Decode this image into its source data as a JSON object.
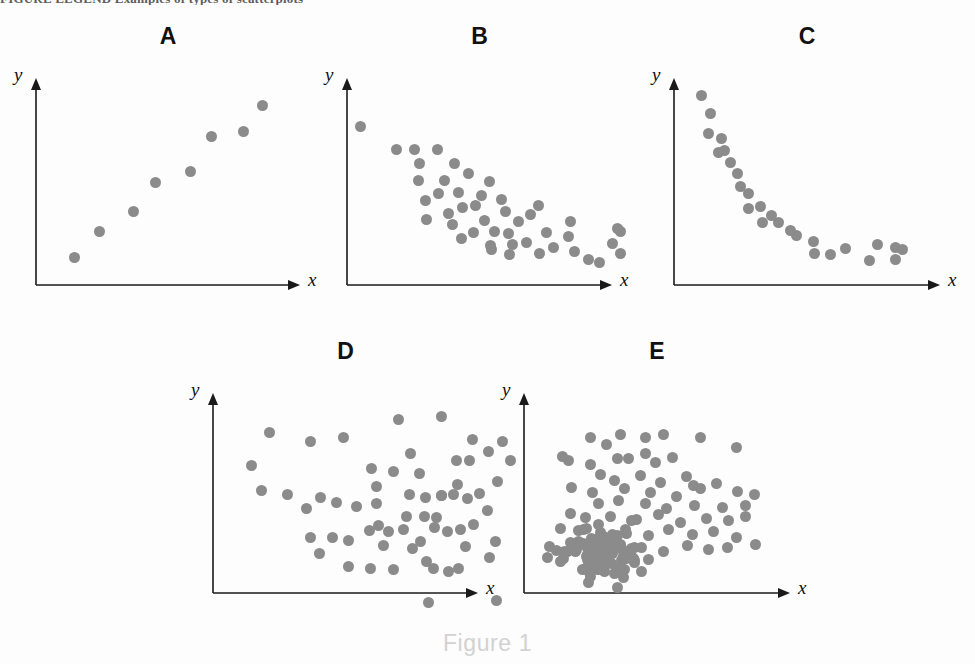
{
  "page": {
    "width": 975,
    "height": 664,
    "background_color": "#fdfdfd",
    "top_clipped_text": "FIGURE LEGEND  Examples of types of scatterplots",
    "caption": "Figure 1"
  },
  "style": {
    "dot_color": "#8b8b8b",
    "axis_color": "#1a1a1a",
    "letter_color": "#111111",
    "caption_color": "#d2d2d2",
    "dot_radius_px": 5.5
  },
  "chart_data": [
    {
      "id": "A",
      "type": "scatter",
      "title": "A",
      "xlabel": "x",
      "ylabel": "y",
      "pattern": "strong positive linear correlation",
      "n_points": 8,
      "axis": {
        "origin_x": 36,
        "origin_y": 285,
        "top_y": 78,
        "right_x": 300
      },
      "points": [
        [
          74,
          257
        ],
        [
          99,
          231
        ],
        [
          133,
          211
        ],
        [
          155,
          182
        ],
        [
          190,
          171
        ],
        [
          211,
          136
        ],
        [
          243,
          131
        ],
        [
          262,
          105
        ]
      ]
    },
    {
      "id": "B",
      "type": "scatter",
      "title": "B",
      "xlabel": "x",
      "ylabel": "y",
      "pattern": "moderate negative correlation with scatter",
      "n_points": 46,
      "axis": {
        "origin_x": 347,
        "origin_y": 285,
        "top_y": 78,
        "right_x": 612
      },
      "points": [
        [
          360,
          126
        ],
        [
          396,
          149
        ],
        [
          414,
          149
        ],
        [
          437,
          149
        ],
        [
          419,
          163
        ],
        [
          418,
          180
        ],
        [
          454,
          163
        ],
        [
          444,
          180
        ],
        [
          438,
          193
        ],
        [
          458,
          192
        ],
        [
          425,
          200
        ],
        [
          468,
          173
        ],
        [
          462,
          207
        ],
        [
          426,
          219
        ],
        [
          448,
          213
        ],
        [
          452,
          224
        ],
        [
          475,
          205
        ],
        [
          481,
          195
        ],
        [
          484,
          220
        ],
        [
          489,
          181
        ],
        [
          501,
          199
        ],
        [
          505,
          211
        ],
        [
          461,
          238
        ],
        [
          473,
          232
        ],
        [
          490,
          245
        ],
        [
          491,
          249
        ],
        [
          494,
          231
        ],
        [
          508,
          233
        ],
        [
          512,
          244
        ],
        [
          518,
          221
        ],
        [
          509,
          254
        ],
        [
          526,
          242
        ],
        [
          530,
          214
        ],
        [
          538,
          205
        ],
        [
          539,
          253
        ],
        [
          546,
          232
        ],
        [
          553,
          247
        ],
        [
          568,
          236
        ],
        [
          570,
          221
        ],
        [
          574,
          251
        ],
        [
          612,
          243
        ],
        [
          617,
          228
        ],
        [
          620,
          231
        ],
        [
          620,
          253
        ],
        [
          588,
          259
        ],
        [
          599,
          262
        ]
      ]
    },
    {
      "id": "C",
      "type": "scatter",
      "title": "C",
      "xlabel": "x",
      "ylabel": "y",
      "pattern": "nonlinear / exponential decay relationship",
      "n_points": 26,
      "axis": {
        "origin_x": 674,
        "origin_y": 285,
        "top_y": 78,
        "right_x": 940
      },
      "points": [
        [
          701,
          95
        ],
        [
          710,
          113
        ],
        [
          708,
          133
        ],
        [
          721,
          138
        ],
        [
          718,
          152
        ],
        [
          724,
          150
        ],
        [
          737,
          173
        ],
        [
          740,
          186
        ],
        [
          748,
          193
        ],
        [
          748,
          208
        ],
        [
          760,
          206
        ],
        [
          762,
          222
        ],
        [
          778,
          222
        ],
        [
          796,
          235
        ],
        [
          813,
          241
        ],
        [
          814,
          253
        ],
        [
          830,
          254
        ],
        [
          845,
          248
        ],
        [
          869,
          260
        ],
        [
          877,
          244
        ],
        [
          895,
          247
        ],
        [
          895,
          259
        ],
        [
          902,
          249
        ],
        [
          790,
          230
        ],
        [
          771,
          215
        ],
        [
          730,
          162
        ]
      ]
    },
    {
      "id": "D",
      "type": "scatter",
      "title": "D",
      "xlabel": "x",
      "ylabel": "y",
      "pattern": "no correlation / random uniform scatter",
      "n_points": 64,
      "axis": {
        "origin_x": 213,
        "origin_y": 593,
        "top_y": 393,
        "right_x": 478
      },
      "points": [
        [
          269,
          432
        ],
        [
          251,
          465
        ],
        [
          310,
          441
        ],
        [
          343,
          437
        ],
        [
          371,
          468
        ],
        [
          398,
          419
        ],
        [
          410,
          453
        ],
        [
          441,
          416
        ],
        [
          441,
          495
        ],
        [
          456,
          460
        ],
        [
          457,
          484
        ],
        [
          469,
          460
        ],
        [
          472,
          439
        ],
        [
          479,
          493
        ],
        [
          261,
          490
        ],
        [
          287,
          494
        ],
        [
          306,
          508
        ],
        [
          320,
          497
        ],
        [
          336,
          502
        ],
        [
          356,
          506
        ],
        [
          376,
          486
        ],
        [
          376,
          503
        ],
        [
          393,
          471
        ],
        [
          406,
          516
        ],
        [
          424,
          516
        ],
        [
          436,
          517
        ],
        [
          441,
          495
        ],
        [
          378,
          525
        ],
        [
          310,
          537
        ],
        [
          332,
          537
        ],
        [
          348,
          540
        ],
        [
          369,
          530
        ],
        [
          388,
          531
        ],
        [
          403,
          529
        ],
        [
          412,
          548
        ],
        [
          420,
          541
        ],
        [
          434,
          527
        ],
        [
          447,
          531
        ],
        [
          460,
          529
        ],
        [
          473,
          524
        ],
        [
          487,
          510
        ],
        [
          497,
          481
        ],
        [
          409,
          494
        ],
        [
          425,
          497
        ],
        [
          453,
          494
        ],
        [
          467,
          498
        ],
        [
          488,
          451
        ],
        [
          502,
          441
        ],
        [
          510,
          460
        ],
        [
          433,
          568
        ],
        [
          448,
          571
        ],
        [
          458,
          568
        ],
        [
          465,
          546
        ],
        [
          489,
          557
        ],
        [
          495,
          541
        ],
        [
          426,
          561
        ],
        [
          393,
          569
        ],
        [
          370,
          568
        ],
        [
          383,
          545
        ],
        [
          348,
          566
        ],
        [
          319,
          553
        ],
        [
          428,
          602
        ],
        [
          496,
          600
        ],
        [
          419,
          473
        ]
      ]
    },
    {
      "id": "E",
      "type": "scatter",
      "title": "E",
      "xlabel": "x",
      "ylabel": "y",
      "pattern": "clustered distribution: dense low-x low-y cluster plus sparse scatter",
      "n_points": 150,
      "axis": {
        "origin_x": 524,
        "origin_y": 593,
        "top_y": 393,
        "right_x": 790
      },
      "sparse_points": [
        [
          590,
          437
        ],
        [
          606,
          444
        ],
        [
          620,
          434
        ],
        [
          645,
          437
        ],
        [
          663,
          434
        ],
        [
          700,
          437
        ],
        [
          736,
          447
        ],
        [
          562,
          456
        ],
        [
          568,
          460
        ],
        [
          590,
          464
        ],
        [
          617,
          458
        ],
        [
          628,
          458
        ],
        [
          645,
          453
        ],
        [
          655,
          462
        ],
        [
          672,
          457
        ],
        [
          600,
          474
        ],
        [
          614,
          480
        ],
        [
          640,
          475
        ],
        [
          660,
          482
        ],
        [
          686,
          476
        ],
        [
          700,
          488
        ],
        [
          571,
          487
        ],
        [
          592,
          492
        ],
        [
          624,
          488
        ],
        [
          650,
          492
        ],
        [
          676,
          496
        ],
        [
          693,
          485
        ],
        [
          716,
          483
        ],
        [
          737,
          491
        ],
        [
          598,
          503
        ],
        [
          618,
          500
        ],
        [
          645,
          503
        ],
        [
          666,
          508
        ],
        [
          694,
          505
        ],
        [
          722,
          507
        ],
        [
          745,
          505
        ],
        [
          570,
          513
        ],
        [
          585,
          517
        ],
        [
          610,
          516
        ],
        [
          636,
          519
        ],
        [
          658,
          514
        ],
        [
          680,
          522
        ],
        [
          706,
          518
        ],
        [
          728,
          520
        ],
        [
          560,
          528
        ],
        [
          578,
          530
        ],
        [
          600,
          532
        ],
        [
          625,
          529
        ],
        [
          648,
          535
        ],
        [
          668,
          529
        ],
        [
          692,
          534
        ],
        [
          713,
          531
        ],
        [
          736,
          537
        ],
        [
          549,
          546
        ],
        [
          570,
          542
        ],
        [
          594,
          548
        ],
        [
          612,
          544
        ],
        [
          641,
          547
        ],
        [
          663,
          551
        ],
        [
          687,
          545
        ],
        [
          708,
          549
        ],
        [
          727,
          547
        ],
        [
          755,
          544
        ],
        [
          745,
          516
        ],
        [
          754,
          494
        ]
      ],
      "cluster": {
        "center_x": 604,
        "center_y": 552,
        "spread_x": 36,
        "spread_y": 24,
        "n": 86
      }
    }
  ],
  "panels": [
    {
      "id": "A",
      "letter": "A",
      "xlabel": "x",
      "ylabel": "y"
    },
    {
      "id": "B",
      "letter": "B",
      "xlabel": "x",
      "ylabel": "y"
    },
    {
      "id": "C",
      "letter": "C",
      "xlabel": "x",
      "ylabel": "y"
    },
    {
      "id": "D",
      "letter": "D",
      "xlabel": "x",
      "ylabel": "y"
    },
    {
      "id": "E",
      "letter": "E",
      "xlabel": "x",
      "ylabel": "y"
    }
  ]
}
